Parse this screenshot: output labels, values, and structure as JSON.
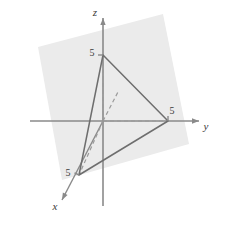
{
  "figure": {
    "background_color": "#ffffff",
    "width": 227,
    "height": 227
  },
  "colors": {
    "axis": "#8a8a8a",
    "plane_fill": "#ebebeb",
    "triangle_stroke": "#6e6e6e",
    "dashed_stroke": "#9a9a9a",
    "text": "#3a3a3a"
  },
  "axes": {
    "origin": {
      "x": 103,
      "y": 121
    },
    "x_axis": {
      "label": "x",
      "label_position": {
        "x": 55,
        "y": 210
      },
      "solid_from": {
        "x": 103,
        "y": 121
      },
      "solid_to": {
        "x": 62,
        "y": 200
      },
      "dashed_from": {
        "x": 103,
        "y": 121
      },
      "dashed_to": {
        "x": 118,
        "y": 92
      },
      "arrow": true
    },
    "y_axis": {
      "label": "y",
      "label_position": {
        "x": 206,
        "y": 130
      },
      "solid_from": {
        "x": 168,
        "y": 121
      },
      "solid_to": {
        "x": 199,
        "y": 121
      },
      "negative_from": {
        "x": 30,
        "y": 121
      },
      "negative_to": {
        "x": 103,
        "y": 121
      },
      "dashed_from": {
        "x": 103,
        "y": 121
      },
      "dashed_to": {
        "x": 168,
        "y": 121
      },
      "arrow": true
    },
    "z_axis": {
      "label": "z",
      "label_position": {
        "x": 95,
        "y": 16
      },
      "solid_from": {
        "x": 103,
        "y": 18
      },
      "solid_to": {
        "x": 103,
        "y": 206
      },
      "dashed_from": {
        "x": 103,
        "y": 55
      },
      "dashed_to": {
        "x": 103,
        "y": 121
      },
      "arrow": true
    }
  },
  "plane": {
    "name": "shaded-plane",
    "fill": "#ebebeb",
    "corners": [
      {
        "x": 38,
        "y": 47
      },
      {
        "x": 163,
        "y": 14
      },
      {
        "x": 189,
        "y": 144
      },
      {
        "x": 62,
        "y": 180
      }
    ]
  },
  "triangle": {
    "name": "intercept-triangle",
    "stroke": "#6e6e6e",
    "vertices": [
      {
        "id": "z-intercept",
        "x": 103,
        "y": 55,
        "label": "5"
      },
      {
        "id": "y-intercept",
        "x": 168,
        "y": 121,
        "label": "5"
      },
      {
        "id": "x-intercept",
        "x": 79,
        "y": 175,
        "label": "5"
      }
    ]
  },
  "tick_labels": [
    {
      "id": "z-tick-5",
      "text": "5",
      "x": 92,
      "y": 56
    },
    {
      "id": "y-tick-5",
      "text": "5",
      "x": 172,
      "y": 114
    },
    {
      "id": "x-tick-5",
      "text": "5",
      "x": 68,
      "y": 176
    }
  ],
  "dashed_segments": [
    {
      "id": "z-to-origin",
      "x1": 103,
      "y1": 55,
      "x2": 103,
      "y2": 121
    },
    {
      "id": "origin-to-y",
      "x1": 103,
      "y1": 121,
      "x2": 168,
      "y2": 121
    },
    {
      "id": "origin-to-x",
      "x1": 103,
      "y1": 121,
      "x2": 79,
      "y2": 175
    },
    {
      "id": "origin-to-x-positive",
      "x1": 103,
      "y1": 121,
      "x2": 118,
      "y2": 92
    }
  ]
}
